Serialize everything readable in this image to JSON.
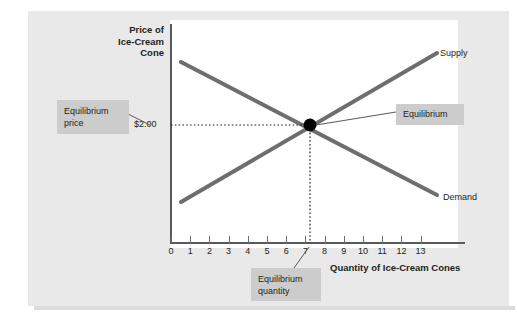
{
  "figure": {
    "y_axis_title": [
      "Price of",
      "Ice-Cream",
      "Cone"
    ],
    "x_axis_title": "Quantity of Ice-Cream Cones",
    "price_tick_label": "$2.00",
    "supply_label": "Supply",
    "demand_label": "Demand",
    "callouts": {
      "equilibrium_price": [
        "Equilibrium",
        "price"
      ],
      "equilibrium_point": "Equilibrium",
      "equilibrium_quantity": [
        "Equilibrium",
        "quantity"
      ]
    },
    "colors": {
      "curve": "#6e6e70",
      "axis": "#58595b",
      "callout_bg": "#cccccc",
      "page_bg": "#e9e9e9",
      "plot_bg": "#ffffff",
      "point": "#000000"
    }
  },
  "chart_data": {
    "type": "line",
    "title": "",
    "xlabel": "Quantity of Ice-Cream Cones",
    "ylabel": "Price of Ice-Cream Cone",
    "xlim": [
      0,
      15.5
    ],
    "ylim": [
      0,
      4.2
    ],
    "grid": false,
    "legend": "inline-curve-labels",
    "x_ticks": [
      "0",
      "1",
      "2",
      "3",
      "4",
      "5",
      "6",
      "7",
      "8",
      "9",
      "10",
      "11",
      "12",
      "13"
    ],
    "x_tick_values": [
      0,
      1,
      2,
      3,
      4,
      5,
      6,
      7,
      8,
      9,
      10,
      11,
      12,
      13
    ],
    "y_ticks": [
      "$2.00"
    ],
    "y_tick_values": [
      2.0
    ],
    "series": [
      {
        "name": "Supply",
        "points": [
          [
            0.6,
            0.75
          ],
          [
            14.0,
            3.45
          ]
        ],
        "label_at": [
          14.3,
          3.55
        ]
      },
      {
        "name": "Demand",
        "points": [
          [
            0.6,
            3.3
          ],
          [
            14.0,
            0.85
          ]
        ],
        "label_at": [
          14.5,
          0.8
        ]
      }
    ],
    "annotations": [
      {
        "name": "equilibrium-point",
        "type": "point",
        "x": 6.9,
        "y": 2.0,
        "label": "Equilibrium"
      },
      {
        "name": "equilibrium-price-guide",
        "type": "dotted-horizontal",
        "y": 2.0,
        "from_x": 0,
        "to_x": 6.9,
        "label": "Equilibrium price",
        "value": "$2.00"
      },
      {
        "name": "equilibrium-quantity-guide",
        "type": "dotted-vertical",
        "x": 6.9,
        "from_y": 0,
        "to_y": 2.0,
        "label": "Equilibrium quantity",
        "value": "7"
      }
    ]
  }
}
